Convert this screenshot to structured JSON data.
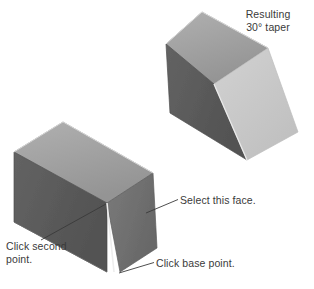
{
  "figure": {
    "background_color": "#ffffff"
  },
  "labels": {
    "resulting_line1": "Resulting",
    "resulting_line2": "30° taper",
    "select_face": "Select this face.",
    "click_base_point": "Click base point.",
    "click_second_line1": "Click second",
    "click_second_line2": "point."
  },
  "colors": {
    "top_face": "#a2a2a2",
    "left_face": "#5b5b5b",
    "right_face_dark": "#6e6e6e",
    "right_face_light": "#c9c9c9",
    "edge_light": "#e8e8e8",
    "outline": "#8a8a8a",
    "leader_line": "#3a3a3a",
    "text": "#3a3a3a"
  },
  "shapes": {
    "taper_solid": {
      "name": "resulting-30-degree-taper-solid",
      "top_face": "202,12 268,48 214,84 166,44",
      "left_face": "166,44 214,84 247,160 170,113",
      "right_face": "214,84 268,48 298,132 247,160"
    },
    "box_solid": {
      "name": "original-box-solid",
      "top_face": "63,122 153,173 107,203 14,152",
      "left_face": "14,152 107,203 107,272 14,222",
      "right_face": "107,203 153,173 157,248 120,272"
    }
  },
  "leaders": {
    "select_face": "178,199 147,213",
    "click_base_point": "154,262 119,273",
    "click_second_point": "40,240 105,204"
  }
}
